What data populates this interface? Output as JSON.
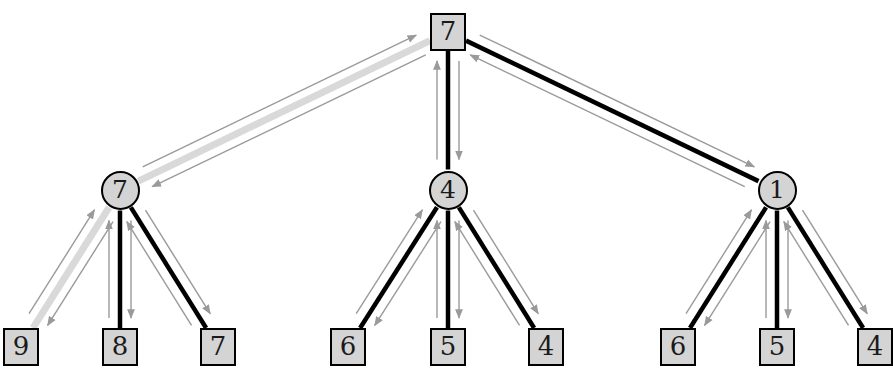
{
  "diagram": {
    "type": "tree-with-message-arrows",
    "colors": {
      "node_fill": "#d4d4d4",
      "node_stroke": "#000000",
      "tree_edge": "#000000",
      "highlight_edge": "#d9d9d9",
      "message_arrow": "#9a9a9a",
      "background": "#ffffff"
    },
    "canvas": {
      "width": 892,
      "height": 373
    }
  },
  "nodes": [
    {
      "id": "root",
      "label": "7",
      "shape": "square",
      "x": 448,
      "y": 32,
      "level": 0
    },
    {
      "id": "m1",
      "label": "7",
      "shape": "circle",
      "x": 120,
      "y": 190,
      "level": 1
    },
    {
      "id": "m2",
      "label": "4",
      "shape": "circle",
      "x": 448,
      "y": 190,
      "level": 1
    },
    {
      "id": "m3",
      "label": "1",
      "shape": "circle",
      "x": 777,
      "y": 190,
      "level": 1
    },
    {
      "id": "l1",
      "label": "9",
      "shape": "square",
      "x": 21,
      "y": 347,
      "level": 2
    },
    {
      "id": "l2",
      "label": "8",
      "shape": "square",
      "x": 120,
      "y": 347,
      "level": 2
    },
    {
      "id": "l3",
      "label": "7",
      "shape": "square",
      "x": 218,
      "y": 347,
      "level": 2
    },
    {
      "id": "l4",
      "label": "6",
      "shape": "square",
      "x": 348,
      "y": 347,
      "level": 2
    },
    {
      "id": "l5",
      "label": "5",
      "shape": "square",
      "x": 448,
      "y": 347,
      "level": 2
    },
    {
      "id": "l6",
      "label": "4",
      "shape": "square",
      "x": 546,
      "y": 347,
      "level": 2
    },
    {
      "id": "l7",
      "label": "6",
      "shape": "square",
      "x": 678,
      "y": 347,
      "level": 2
    },
    {
      "id": "l8",
      "label": "5",
      "shape": "square",
      "x": 777,
      "y": 347,
      "level": 2
    },
    {
      "id": "l9",
      "label": "4",
      "shape": "square",
      "x": 875,
      "y": 347,
      "level": 2
    }
  ],
  "edges": [
    {
      "from": "root",
      "to": "m1",
      "style": "highlight"
    },
    {
      "from": "root",
      "to": "m2",
      "style": "normal"
    },
    {
      "from": "root",
      "to": "m3",
      "style": "normal"
    },
    {
      "from": "m1",
      "to": "l1",
      "style": "highlight"
    },
    {
      "from": "m1",
      "to": "l2",
      "style": "normal"
    },
    {
      "from": "m1",
      "to": "l3",
      "style": "normal"
    },
    {
      "from": "m2",
      "to": "l4",
      "style": "normal"
    },
    {
      "from": "m2",
      "to": "l5",
      "style": "normal"
    },
    {
      "from": "m2",
      "to": "l6",
      "style": "normal"
    },
    {
      "from": "m3",
      "to": "l7",
      "style": "normal"
    },
    {
      "from": "m3",
      "to": "l8",
      "style": "normal"
    },
    {
      "from": "m3",
      "to": "l9",
      "style": "normal"
    }
  ],
  "message_arrows": [
    {
      "along": "root-m1",
      "direction": "down",
      "note": "parent to child"
    },
    {
      "along": "root-m1",
      "direction": "up",
      "note": "child to parent"
    },
    {
      "along": "root-m2",
      "direction": "down",
      "note": "parent to child"
    },
    {
      "along": "root-m2",
      "direction": "up",
      "note": "child to parent"
    },
    {
      "along": "root-m3",
      "direction": "down",
      "note": "parent to child"
    },
    {
      "along": "root-m3",
      "direction": "up",
      "note": "child to parent"
    },
    {
      "along": "m1-l1",
      "direction": "down",
      "note": "parent to child"
    },
    {
      "along": "m1-l1",
      "direction": "up",
      "note": "child to parent"
    },
    {
      "along": "m1-l2",
      "direction": "down",
      "note": "parent to child"
    },
    {
      "along": "m1-l2",
      "direction": "up",
      "note": "child to parent"
    },
    {
      "along": "m1-l3",
      "direction": "down",
      "note": "parent to child"
    },
    {
      "along": "m1-l3",
      "direction": "up",
      "note": "child to parent"
    },
    {
      "along": "m2-l4",
      "direction": "down",
      "note": "parent to child"
    },
    {
      "along": "m2-l4",
      "direction": "up",
      "note": "child to parent"
    },
    {
      "along": "m2-l5",
      "direction": "down",
      "note": "parent to child"
    },
    {
      "along": "m2-l5",
      "direction": "up",
      "note": "child to parent"
    },
    {
      "along": "m2-l6",
      "direction": "down",
      "note": "parent to child"
    },
    {
      "along": "m2-l6",
      "direction": "up",
      "note": "child to parent"
    },
    {
      "along": "m3-l7",
      "direction": "down",
      "note": "parent to child"
    },
    {
      "along": "m3-l7",
      "direction": "up",
      "note": "child to parent"
    },
    {
      "along": "m3-l8",
      "direction": "down",
      "note": "parent to child"
    },
    {
      "along": "m3-l8",
      "direction": "up",
      "note": "child to parent"
    },
    {
      "along": "m3-l9",
      "direction": "down",
      "note": "parent to child"
    },
    {
      "along": "m3-l9",
      "direction": "up",
      "note": "child to parent"
    }
  ]
}
